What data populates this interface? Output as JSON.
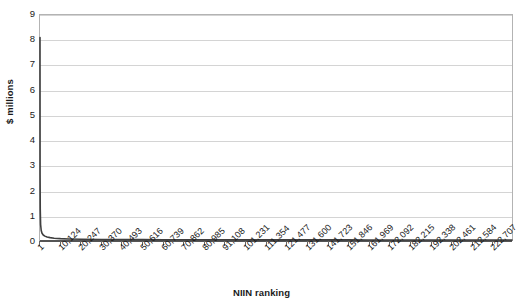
{
  "chart_data": {
    "type": "line",
    "title": "",
    "xlabel": "NIIN ranking",
    "ylabel": "$ millions",
    "grid": true,
    "legend": false,
    "xlim": [
      1,
      232830
    ],
    "ylim": [
      0,
      9
    ],
    "y_ticks": [
      0,
      1,
      2,
      3,
      4,
      5,
      6,
      7,
      8,
      9
    ],
    "y_tick_labels": [
      "0",
      "1",
      "2",
      "3",
      "4",
      "5",
      "6",
      "7",
      "8",
      "9"
    ],
    "x_tick_labels": [
      "1",
      "10,124",
      "20,247",
      "30,370",
      "40,493",
      "50,616",
      "60,739",
      "70,862",
      "80,985",
      "91,108",
      "101,231",
      "111,354",
      "121,477",
      "131,600",
      "141,723",
      "151,846",
      "161,969",
      "172,092",
      "182,215",
      "192,338",
      "202,461",
      "212,584",
      "222,707"
    ],
    "x_tick_values": [
      1,
      10124,
      20247,
      30370,
      40493,
      50616,
      60739,
      70862,
      80985,
      91108,
      101231,
      111354,
      121477,
      131600,
      141723,
      151846,
      161969,
      172092,
      182215,
      192338,
      202461,
      212584,
      222707
    ],
    "series": [
      {
        "name": "Annual demand value by NIIN rank",
        "color": "#3f3f3f",
        "x": [
          1,
          40,
          120,
          300,
          600,
          1000,
          1600,
          2400,
          3500,
          5000,
          7000,
          10124,
          14000,
          20247,
          30370,
          40493,
          50616,
          60739,
          70862,
          80985,
          91108,
          101231,
          111354,
          121477,
          131600,
          141723,
          151846,
          161969,
          172092,
          182215,
          192338,
          202461,
          212584,
          222707,
          232830
        ],
        "y": [
          8.1,
          2.6,
          1.25,
          0.62,
          0.38,
          0.27,
          0.2,
          0.155,
          0.12,
          0.095,
          0.072,
          0.055,
          0.042,
          0.031,
          0.022,
          0.017,
          0.014,
          0.012,
          0.0105,
          0.0092,
          0.0081,
          0.0071,
          0.0062,
          0.0054,
          0.0047,
          0.004,
          0.0034,
          0.0028,
          0.0023,
          0.0018,
          0.0014,
          0.001,
          0.0007,
          0.0004,
          0.0002
        ]
      }
    ]
  }
}
